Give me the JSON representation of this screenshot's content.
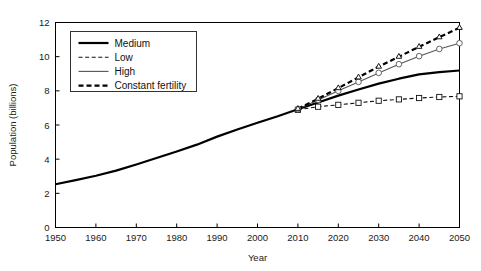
{
  "chart_data": {
    "type": "line",
    "title": "",
    "xlabel": "Year",
    "ylabel": "Population (billions)",
    "xlim": [
      1950,
      2050
    ],
    "ylim": [
      0,
      12
    ],
    "xticks": [
      1950,
      1960,
      1970,
      1980,
      1990,
      2000,
      2010,
      2020,
      2030,
      2040,
      2050
    ],
    "yticks": [
      0,
      2,
      4,
      6,
      8,
      10,
      12
    ],
    "grid": false,
    "legend_position": "upper-left",
    "series": [
      {
        "name": "Medium",
        "style": "solid",
        "width": 2.2,
        "color": "#000000",
        "marker": "none",
        "x": [
          1950,
          1955,
          1960,
          1965,
          1970,
          1975,
          1980,
          1985,
          1990,
          1995,
          2000,
          2005,
          2010,
          2015,
          2020,
          2025,
          2030,
          2035,
          2040,
          2045,
          2050
        ],
        "y": [
          2.53,
          2.77,
          3.03,
          3.33,
          3.69,
          4.07,
          4.45,
          4.85,
          5.32,
          5.74,
          6.13,
          6.51,
          6.92,
          7.32,
          7.72,
          8.08,
          8.42,
          8.71,
          8.96,
          9.1,
          9.19
        ]
      },
      {
        "name": "Low",
        "style": "dashed",
        "width": 1.1,
        "color": "#111111",
        "marker": "square",
        "x": [
          2010,
          2015,
          2020,
          2025,
          2030,
          2035,
          2040,
          2045,
          2050
        ],
        "y": [
          6.89,
          7.07,
          7.18,
          7.3,
          7.42,
          7.5,
          7.58,
          7.64,
          7.68
        ]
      },
      {
        "name": "High",
        "style": "solid",
        "width": 1.1,
        "color": "#555555",
        "marker": "circle",
        "x": [
          2010,
          2015,
          2020,
          2025,
          2030,
          2035,
          2040,
          2045,
          2050
        ],
        "y": [
          6.93,
          7.47,
          8.0,
          8.52,
          9.05,
          9.56,
          10.03,
          10.45,
          10.79
        ]
      },
      {
        "name": "Constant fertility",
        "style": "dashed",
        "width": 2.2,
        "color": "#000000",
        "marker": "triangle",
        "x": [
          2010,
          2015,
          2020,
          2025,
          2030,
          2035,
          2040,
          2045,
          2050
        ],
        "y": [
          6.95,
          7.54,
          8.16,
          8.79,
          9.42,
          10.0,
          10.58,
          11.14,
          11.69
        ]
      }
    ],
    "legend_entries": [
      {
        "label": "Medium",
        "style": "solid",
        "width": 2.2,
        "color": "#000000"
      },
      {
        "label": "Low",
        "style": "dashed",
        "width": 1.1,
        "color": "#111111"
      },
      {
        "label": "High",
        "style": "solid",
        "width": 1.1,
        "color": "#555555"
      },
      {
        "label": "Constant fertility",
        "style": "dashed",
        "width": 2.2,
        "color": "#000000"
      }
    ]
  }
}
